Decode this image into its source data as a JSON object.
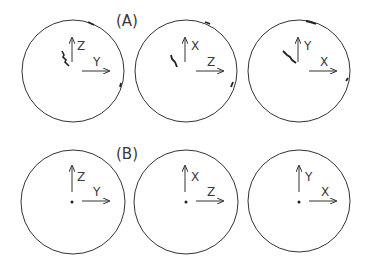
{
  "figure": {
    "rows": [
      {
        "label": "(A)",
        "panels": [
          {
            "vertical_axis": "Z",
            "horizontal_axis": "Y",
            "trace": "scattered"
          },
          {
            "vertical_axis": "X",
            "horizontal_axis": "Z",
            "trace": "scattered"
          },
          {
            "vertical_axis": "Y",
            "horizontal_axis": "X",
            "trace": "scattered"
          }
        ]
      },
      {
        "label": "(B)",
        "panels": [
          {
            "vertical_axis": "Z",
            "horizontal_axis": "Y",
            "trace": "point"
          },
          {
            "vertical_axis": "X",
            "horizontal_axis": "Z",
            "trace": "point"
          },
          {
            "vertical_axis": "Y",
            "horizontal_axis": "X",
            "trace": "point"
          }
        ]
      }
    ],
    "colors": {
      "line": "#333333",
      "background": "#ffffff"
    }
  }
}
